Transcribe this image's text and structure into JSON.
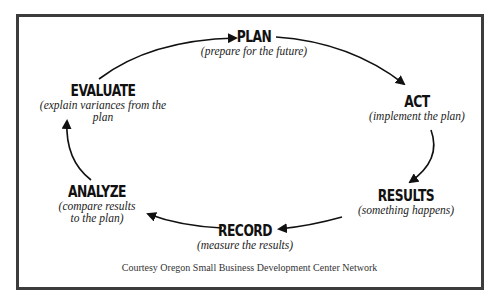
{
  "diagram": {
    "type": "cycle",
    "nodes": [
      {
        "id": "plan",
        "title": "PLAN",
        "subtitle": "(prepare for the future)"
      },
      {
        "id": "act",
        "title": "ACT",
        "subtitle": "(implement the plan)"
      },
      {
        "id": "results",
        "title": "RESULTS",
        "subtitle": "(something happens)"
      },
      {
        "id": "record",
        "title": "RECORD",
        "subtitle": "(measure the results)"
      },
      {
        "id": "analyze",
        "title": "ANALYZE",
        "subtitle_lines": [
          "(compare results",
          "to the plan)"
        ]
      },
      {
        "id": "evaluate",
        "title": "EVALUATE",
        "subtitle_lines": [
          "(explain variances from the",
          "plan"
        ]
      }
    ],
    "edges": [
      {
        "from": "evaluate",
        "to": "plan"
      },
      {
        "from": "plan",
        "to": "act"
      },
      {
        "from": "act",
        "to": "results"
      },
      {
        "from": "results",
        "to": "record"
      },
      {
        "from": "record",
        "to": "analyze"
      },
      {
        "from": "analyze",
        "to": "evaluate"
      }
    ],
    "footer": "Courtesy Oregon Small Business Development Center Network",
    "colors": {
      "border": "#3c3c3c",
      "text": "#111111",
      "arrow": "#111111"
    }
  }
}
